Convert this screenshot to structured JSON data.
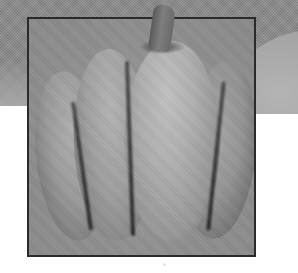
{
  "image": {
    "subject": "pumpkin",
    "description": "Grayscale halftone photograph of a ribbed pumpkin with stem, enclosed in a dark square frame, over a gray upper background and white lower area",
    "style": "grayscale halftone print",
    "colors": {
      "background_gray": "#8c8c8c",
      "lower_background": "#ffffff",
      "frame_border": "#2a2a2a",
      "highlight": "#c2c2c2",
      "shadow": "#383838"
    },
    "frame": {
      "x": 27,
      "y": 17,
      "width": 227,
      "height": 238
    },
    "lobes_visible": 4,
    "stem": "yes"
  }
}
